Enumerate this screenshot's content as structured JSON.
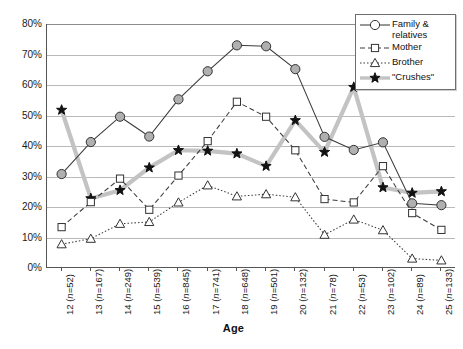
{
  "chart_data": {
    "type": "line",
    "title": "",
    "xlabel": "Age",
    "ylabel": "",
    "ylim": [
      0,
      80
    ],
    "yticks": [
      0,
      10,
      20,
      30,
      40,
      50,
      60,
      70,
      80
    ],
    "ytick_labels": [
      "0%",
      "10%",
      "20%",
      "30%",
      "40%",
      "50%",
      "60%",
      "70%",
      "80%"
    ],
    "grid": true,
    "legend_position": "top-right",
    "categories": [
      "12 (n=52)",
      "13 (n=167)",
      "14 (n=249)",
      "15 (n=539)",
      "16 (n=845)",
      "17 (n=741)",
      "18 (n=648)",
      "19 (n=501)",
      "20 (n=132)",
      "21 (n=78)",
      "22 (n=53)",
      "23 (n=102)",
      "24 (n=89)",
      "25 (n=133)"
    ],
    "x": [
      12,
      13,
      14,
      15,
      16,
      17,
      18,
      19,
      20,
      21,
      22,
      23,
      24,
      25
    ],
    "counts": [
      52,
      167,
      249,
      539,
      845,
      741,
      648,
      501,
      132,
      78,
      53,
      102,
      89,
      133
    ],
    "series": [
      {
        "name": "Family & relatives",
        "marker": "circle",
        "line_style": "solid",
        "color": "#3b3b3b",
        "values": [
          30.8,
          41.3,
          49.6,
          43.1,
          55.3,
          64.5,
          73.0,
          72.7,
          65.2,
          43.0,
          38.7,
          41.2,
          21.2,
          20.6
        ]
      },
      {
        "name": "Mother",
        "marker": "square",
        "line_style": "dashed",
        "color": "#3b3b3b",
        "values": [
          13.4,
          21.6,
          29.3,
          19.1,
          30.3,
          41.6,
          54.5,
          49.6,
          38.6,
          22.6,
          21.5,
          33.4,
          18.0,
          12.5
        ]
      },
      {
        "name": "Brother",
        "marker": "triangle",
        "line_style": "dotted",
        "color": "#3b3b3b",
        "values": [
          7.8,
          9.6,
          14.5,
          15.1,
          21.5,
          27.1,
          23.5,
          24.2,
          23.2,
          10.9,
          15.9,
          12.4,
          3.1,
          2.5
        ]
      },
      {
        "name": "\"Crushes\"",
        "marker": "star",
        "line_style": "solid-thick-gray",
        "color": "#c3c3c3",
        "marker_color": "#111111",
        "values": [
          51.8,
          22.8,
          25.5,
          32.9,
          38.6,
          38.4,
          37.5,
          33.4,
          48.4,
          38.0,
          59.3,
          26.4,
          24.6,
          25.1
        ]
      }
    ]
  },
  "legend": {
    "entries": [
      {
        "label": "Family &\nrelatives",
        "icon": "circle-marker-solid-line-icon"
      },
      {
        "label": "Mother",
        "icon": "square-marker-dashed-line-icon"
      },
      {
        "label": "Brother",
        "icon": "triangle-marker-dotted-line-icon"
      },
      {
        "label": "\"Crushes\"",
        "icon": "star-marker-thick-gray-line-icon"
      }
    ]
  },
  "axis": {
    "x_title": "Age"
  },
  "colors": {
    "series_line": "#3b3b3b",
    "crushes_line": "#c3c3c3",
    "gridline": "#b9b9b9",
    "axis": "#555555",
    "marker_fill": "#b0b0b0",
    "background": "#ffffff"
  }
}
